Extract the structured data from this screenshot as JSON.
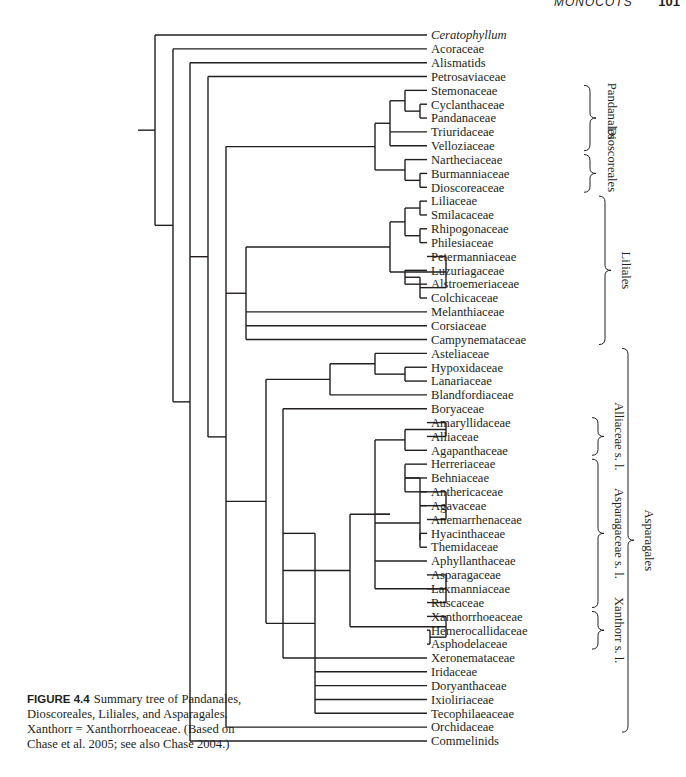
{
  "header": {
    "section": "MONOCOTS",
    "page_number": "101"
  },
  "caption": {
    "figure_label": "FIGURE 4.4",
    "text": "Summary tree of Pandanales, Dioscoreales, Liliales, and Asparagales. Xanthorr = Xanthorrhoeaceae. (Based on Chase et al. 2005; see also Chase 2004.)"
  },
  "tree": {
    "leaves": [
      {
        "name": "Ceratophyllum",
        "italic": true
      },
      {
        "name": "Acoraceae"
      },
      {
        "name": "Alismatids"
      },
      {
        "name": "Petrosaviaceae"
      },
      {
        "name": "Stemonaceae"
      },
      {
        "name": "Cyclanthaceae"
      },
      {
        "name": "Pandanaceae"
      },
      {
        "name": "Triuridaceae"
      },
      {
        "name": "Velloziaceae"
      },
      {
        "name": "Nartheciaceae"
      },
      {
        "name": "Burmanniaceae"
      },
      {
        "name": "Dioscoreaceae"
      },
      {
        "name": "Liliaceae"
      },
      {
        "name": "Smilacaceae"
      },
      {
        "name": "Rhipogonaceae"
      },
      {
        "name": "Philesiaceae"
      },
      {
        "name": "Petermanniaceae"
      },
      {
        "name": "Luzuriagaceae"
      },
      {
        "name": "Alstroemeriaceae"
      },
      {
        "name": "Colchicaceae"
      },
      {
        "name": "Melanthiaceae"
      },
      {
        "name": "Corsiaceae"
      },
      {
        "name": "Campynemataceae"
      },
      {
        "name": "Asteliaceae"
      },
      {
        "name": "Hypoxidaceae"
      },
      {
        "name": "Lanariaceae"
      },
      {
        "name": "Blandfordiaceae"
      },
      {
        "name": "Boryaceae"
      },
      {
        "name": "Amaryllidaceae"
      },
      {
        "name": "Alliaceae"
      },
      {
        "name": "Agapanthaceae"
      },
      {
        "name": "Herreriaceae"
      },
      {
        "name": "Behniaceae"
      },
      {
        "name": "Anthericaceae"
      },
      {
        "name": "Agavaceae"
      },
      {
        "name": "Anemarrhenaceae"
      },
      {
        "name": "Hyacinthaceae"
      },
      {
        "name": "Themidaceae"
      },
      {
        "name": "Aphyllanthaceae"
      },
      {
        "name": "Asparagaceae"
      },
      {
        "name": "Laxmanniaceae"
      },
      {
        "name": "Ruscaceae"
      },
      {
        "name": "Xanthorrhoeaceae"
      },
      {
        "name": "Hemerocallidaceae"
      },
      {
        "name": "Asphodelaceae"
      },
      {
        "name": "Xeronemataceae"
      },
      {
        "name": "Iridaceae"
      },
      {
        "name": "Doryanthaceae"
      },
      {
        "name": "Ixioliriaceae"
      },
      {
        "name": "Tecophilaeaceae"
      },
      {
        "name": "Orchidaceae"
      },
      {
        "name": "Commelinids"
      }
    ],
    "newick": "(Ceratophyllum,(Acoraceae,(Alismatids,(Petrosaviaceae,((((Stemonaceae,(Cyclanthaceae,Pandanaceae)),Triuridaceae,Velloziaceae),(Nartheciaceae,(Burmanniaceae,Dioscoreaceae))),((((Liliaceae,Smilacaceae),(Rhipogonaceae,Philesiaceae)),(Petermanniaceae,((Luzuriagaceae,Alstroemeriaceae),Colchicaceae))),Melanthiaceae,Corsiaceae,Campynemataceae),(((Asteliaceae,(Hypoxidaceae,Lanariaceae)),Blandfordiaceae),((Boryaceae,(((((Amaryllidaceae,Alliaceae),Agapanthaceae),((((Herreriaceae,Behniaceae,Anthericaceae),Agavaceae),Anemarrhenaceae),(Hyacinthaceae,Themidaceae)),Aphyllanthaceae,(Asparagaceae,Laxmanniaceae,Ruscaceae))),(Xanthorrhoeaceae,(Hemerocallidaceae,Asphodelaceae))),Xeronemataceae),Iridaceae,Doryanthaceae,Ixioliriaceae,Tecophilaeaceae)),Orchidaceae)),Commelinids))))));",
    "groups": [
      {
        "label": "Pandanales",
        "from": "Stemonaceae",
        "to": "Velloziaceae"
      },
      {
        "label": "Dioscoreales",
        "from": "Nartheciaceae",
        "to": "Dioscoreaceae"
      },
      {
        "label": "Liliales",
        "from": "Liliaceae",
        "to": "Campynemataceae"
      },
      {
        "label": "Alliaceae s. l.",
        "from": "Amaryllidaceae",
        "to": "Agapanthaceae"
      },
      {
        "label": "Asparagaceae s. l.",
        "from": "Herreriaceae",
        "to": "Ruscaceae"
      },
      {
        "label": "Xanthorr s. l.",
        "from": "Xanthorrhoeaceae",
        "to": "Asphodelaceae"
      },
      {
        "label": "Asparagales",
        "from": "Asteliaceae",
        "to": "Orchidaceae"
      }
    ]
  }
}
